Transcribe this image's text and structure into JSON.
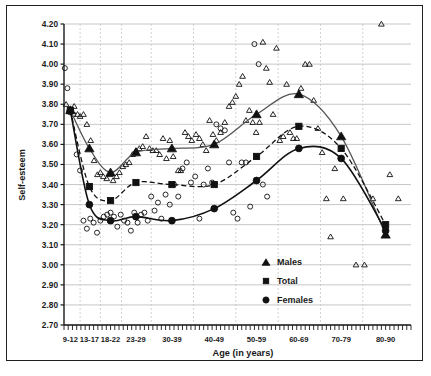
{
  "chart_data": {
    "type": "scatter",
    "title": "",
    "xlabel": "Age (in years)",
    "ylabel": "Self-esteem",
    "ylim": [
      2.7,
      4.2
    ],
    "ytick_step": 0.1,
    "yticks": [
      "4.20",
      "4.10",
      "4.00",
      "3.90",
      "3.80",
      "3.70",
      "3.60",
      "3.50",
      "3.40",
      "3.30",
      "3.20",
      "3.10",
      "3.00",
      "2.90",
      "2.80",
      "2.70"
    ],
    "categories": [
      "9-12",
      "13-17",
      "18-22",
      "23-29",
      "30-39",
      "40-49",
      "50-59",
      "60-69",
      "70-79",
      "80-90"
    ],
    "grid": "horizontal-solid-and-vertical-dashed",
    "legend_position": "inside-lower-right",
    "legend": [
      {
        "name": "Males",
        "marker": "triangle-filled"
      },
      {
        "name": "Total",
        "marker": "square-filled"
      },
      {
        "name": "Females",
        "marker": "circle-filled"
      }
    ],
    "series": [
      {
        "name": "Males",
        "marker": "triangle",
        "line": "solid-gray",
        "categories": [
          "9-12",
          "13-17",
          "18-22",
          "23-29",
          "30-39",
          "40-49",
          "50-59",
          "60-69",
          "70-79",
          "80-90"
        ],
        "values": [
          3.77,
          3.58,
          3.46,
          3.56,
          3.58,
          3.6,
          3.75,
          3.85,
          3.64,
          3.15
        ]
      },
      {
        "name": "Total",
        "marker": "square",
        "line": "dashed-black",
        "categories": [
          "9-12",
          "13-17",
          "18-22",
          "23-29",
          "30-39",
          "40-49",
          "50-59",
          "60-69",
          "70-79",
          "80-90"
        ],
        "values": [
          3.77,
          3.39,
          3.32,
          3.41,
          3.4,
          3.4,
          3.54,
          3.69,
          3.58,
          3.2
        ]
      },
      {
        "name": "Females",
        "marker": "circle",
        "line": "solid-black",
        "categories": [
          "9-12",
          "13-17",
          "18-22",
          "23-29",
          "30-39",
          "40-49",
          "50-59",
          "60-69",
          "70-79",
          "80-90"
        ],
        "values": [
          3.77,
          3.3,
          3.22,
          3.24,
          3.22,
          3.28,
          3.42,
          3.58,
          3.53,
          3.17
        ]
      }
    ],
    "scatter_males": [
      [
        9.5,
        3.8
      ],
      [
        10.2,
        3.77
      ],
      [
        11.4,
        3.79
      ],
      [
        12.2,
        3.75
      ],
      [
        12.8,
        3.74
      ],
      [
        13.6,
        3.75
      ],
      [
        14.4,
        3.7
      ],
      [
        15.3,
        3.62
      ],
      [
        16.1,
        3.52
      ],
      [
        16.9,
        3.45
      ],
      [
        17.6,
        3.46
      ],
      [
        18.3,
        3.44
      ],
      [
        19.1,
        3.43
      ],
      [
        19.9,
        3.45
      ],
      [
        20.6,
        3.42
      ],
      [
        21.4,
        3.44
      ],
      [
        22.1,
        3.46
      ],
      [
        22.9,
        3.49
      ],
      [
        23.6,
        3.5
      ],
      [
        24.4,
        3.51
      ],
      [
        25.2,
        3.55
      ],
      [
        26.0,
        3.57
      ],
      [
        26.8,
        3.58
      ],
      [
        27.6,
        3.59
      ],
      [
        28.4,
        3.64
      ],
      [
        29.2,
        3.58
      ],
      [
        30.0,
        3.57
      ],
      [
        30.8,
        3.57
      ],
      [
        31.6,
        3.55
      ],
      [
        32.4,
        3.63
      ],
      [
        33.2,
        3.53
      ],
      [
        34.0,
        3.62
      ],
      [
        34.8,
        3.54
      ],
      [
        36.0,
        3.47
      ],
      [
        36.6,
        3.47
      ],
      [
        37.6,
        3.66
      ],
      [
        38.4,
        3.64
      ],
      [
        39.2,
        3.62
      ],
      [
        40.2,
        3.65
      ],
      [
        41.0,
        3.63
      ],
      [
        41.8,
        3.6
      ],
      [
        42.6,
        3.57
      ],
      [
        43.4,
        3.72
      ],
      [
        44.2,
        3.65
      ],
      [
        45.0,
        3.62
      ],
      [
        46.0,
        3.66
      ],
      [
        47.0,
        3.71
      ],
      [
        48.0,
        3.79
      ],
      [
        48.8,
        3.81
      ],
      [
        49.6,
        3.84
      ],
      [
        50.4,
        3.9
      ],
      [
        51.2,
        3.94
      ],
      [
        52.0,
        3.72
      ],
      [
        52.8,
        3.77
      ],
      [
        53.6,
        3.71
      ],
      [
        54.4,
        3.66
      ],
      [
        55.2,
        3.71
      ],
      [
        56.0,
        4.11
      ],
      [
        56.8,
        3.98
      ],
      [
        57.6,
        3.91
      ],
      [
        58.4,
        3.75
      ],
      [
        59.2,
        4.08
      ],
      [
        60.0,
        3.62
      ],
      [
        60.8,
        3.64
      ],
      [
        61.6,
        3.9
      ],
      [
        62.4,
        3.66
      ],
      [
        63.2,
        3.63
      ],
      [
        64.0,
        3.63
      ],
      [
        65.0,
        3.88
      ],
      [
        66.0,
        4.0
      ],
      [
        67.0,
        4.0
      ],
      [
        68.0,
        3.82
      ],
      [
        69.0,
        3.68
      ],
      [
        70.0,
        3.56
      ],
      [
        71.0,
        3.33
      ],
      [
        72.0,
        3.14
      ],
      [
        73.0,
        3.48
      ],
      [
        75.0,
        3.33
      ],
      [
        78.0,
        3.0
      ],
      [
        80.0,
        3.0
      ],
      [
        82.0,
        3.33
      ],
      [
        84.0,
        4.2
      ],
      [
        86.0,
        3.45
      ],
      [
        88.0,
        3.33
      ]
    ],
    "scatter_females": [
      [
        9.2,
        3.98
      ],
      [
        9.8,
        3.88
      ],
      [
        10.4,
        3.76
      ],
      [
        11.2,
        3.75
      ],
      [
        12.0,
        3.55
      ],
      [
        12.8,
        3.47
      ],
      [
        13.6,
        3.22
      ],
      [
        14.4,
        3.18
      ],
      [
        15.2,
        3.23
      ],
      [
        16.0,
        3.21
      ],
      [
        16.8,
        3.16
      ],
      [
        17.6,
        3.22
      ],
      [
        18.4,
        3.24
      ],
      [
        19.2,
        3.25
      ],
      [
        20.0,
        3.26
      ],
      [
        20.8,
        3.24
      ],
      [
        21.6,
        3.19
      ],
      [
        22.4,
        3.25
      ],
      [
        23.2,
        3.22
      ],
      [
        24.0,
        3.21
      ],
      [
        24.8,
        3.17
      ],
      [
        25.6,
        3.26
      ],
      [
        26.4,
        3.21
      ],
      [
        27.2,
        3.25
      ],
      [
        28.0,
        3.26
      ],
      [
        28.8,
        3.22
      ],
      [
        29.6,
        3.34
      ],
      [
        30.4,
        3.27
      ],
      [
        31.2,
        3.31
      ],
      [
        32.0,
        3.23
      ],
      [
        33.0,
        3.35
      ],
      [
        34.0,
        3.3
      ],
      [
        35.0,
        3.4
      ],
      [
        36.0,
        3.34
      ],
      [
        37.0,
        3.48
      ],
      [
        38.0,
        3.51
      ],
      [
        39.0,
        3.41
      ],
      [
        40.0,
        3.44
      ],
      [
        41.0,
        3.23
      ],
      [
        42.0,
        3.4
      ],
      [
        43.0,
        3.48
      ],
      [
        44.0,
        3.41
      ],
      [
        45.0,
        3.7
      ],
      [
        46.0,
        3.68
      ],
      [
        47.0,
        3.67
      ],
      [
        48.0,
        3.51
      ],
      [
        49.0,
        3.26
      ],
      [
        50.0,
        3.23
      ],
      [
        51.0,
        3.51
      ],
      [
        52.0,
        3.51
      ],
      [
        53.0,
        3.29
      ],
      [
        54.0,
        4.1
      ],
      [
        55.0,
        4.0
      ],
      [
        56.0,
        3.4
      ],
      [
        57.0,
        3.34
      ]
    ]
  }
}
